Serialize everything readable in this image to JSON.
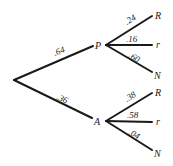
{
  "diagram": {
    "type": "probability-tree",
    "root": {
      "branches": [
        {
          "node": "P",
          "probability": ".64",
          "children": [
            {
              "node": "R",
              "probability": ".24"
            },
            {
              "node": "r",
              "probability": ".16"
            },
            {
              "node": "N",
              "probability": ".60"
            }
          ]
        },
        {
          "node": "A",
          "probability": ".36",
          "children": [
            {
              "node": "R",
              "probability": ".38"
            },
            {
              "node": "r",
              "probability": ".58"
            },
            {
              "node": "N",
              "probability": ".04"
            }
          ]
        }
      ]
    },
    "colors": {
      "line": "#1a1a1a",
      "background": "#ffffff"
    }
  }
}
